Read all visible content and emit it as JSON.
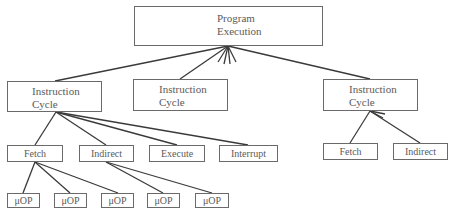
{
  "diagram": {
    "root": {
      "line1": "Program",
      "line2": "Execution"
    },
    "instruction_cycles": [
      {
        "line1": "Instruction",
        "line2": "Cycle"
      },
      {
        "line1": "Instruction",
        "line2": "Cycle"
      },
      {
        "line1": "Instruction",
        "line2": "Cycle"
      }
    ],
    "left_subcycles": [
      "Fetch",
      "Indirect",
      "Execute",
      "Interrupt"
    ],
    "right_subcycles": [
      "Fetch",
      "Indirect"
    ],
    "micro_ops": [
      "μOP",
      "μOP",
      "μOP",
      "μOP",
      "μOP"
    ],
    "colors": {
      "line": "#3a3a3a",
      "border": "#6a6a6a",
      "text": "#5a5a5a"
    }
  }
}
